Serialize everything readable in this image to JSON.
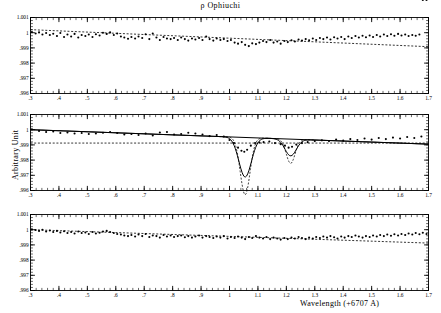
{
  "figure": {
    "title": "ρ Ophiuchi",
    "xlabel": "Wavelength (+6707 A)",
    "ylabel": "Arbitrary Unit"
  },
  "chart_data": {
    "type": "scatter",
    "title": "ρ Ophiuchi",
    "xlabel": "Wavelength (+6707 A)",
    "ylabel": "Arbitrary Unit",
    "xlim": [
      0.3,
      1.7
    ],
    "ylim": [
      0.996,
      1.001
    ],
    "xticks": [
      ".3",
      ".4",
      ".5",
      ".6",
      ".7",
      ".8",
      ".9",
      "1",
      "1.1",
      "1.2",
      "1.3",
      "1.4",
      "1.5",
      "1.6",
      "1.7"
    ],
    "xtick_values": [
      0.3,
      0.4,
      0.5,
      0.6,
      0.7,
      0.8,
      0.9,
      1.0,
      1.1,
      1.2,
      1.3,
      1.4,
      1.5,
      1.6,
      1.7
    ],
    "yticks": [
      "1.001",
      "1",
      ".999",
      ".998",
      ".997",
      ".996"
    ],
    "ytick_values": [
      1.001,
      1.0,
      0.999,
      0.998,
      0.997,
      0.996
    ],
    "minor_tick_step": 0.02,
    "grid": false,
    "legend": null,
    "panels": [
      {
        "name": "top-panel-observed-spectrum",
        "baseline": {
          "type": "dashed-line",
          "x": [
            0.3,
            1.7
          ],
          "y": [
            1.0002,
            0.99908
          ]
        },
        "series": [
          {
            "name": "observed flux",
            "marker": "filled-circle",
            "x": [
              0.305,
              0.318,
              0.33,
              0.342,
              0.355,
              0.368,
              0.38,
              0.393,
              0.405,
              0.418,
              0.43,
              0.443,
              0.455,
              0.468,
              0.48,
              0.493,
              0.505,
              0.518,
              0.53,
              0.543,
              0.555,
              0.568,
              0.58,
              0.593,
              0.605,
              0.618,
              0.63,
              0.643,
              0.655,
              0.668,
              0.68,
              0.693,
              0.705,
              0.718,
              0.73,
              0.743,
              0.755,
              0.768,
              0.78,
              0.793,
              0.805,
              0.818,
              0.83,
              0.843,
              0.855,
              0.868,
              0.88,
              0.893,
              0.905,
              0.918,
              0.93,
              0.943,
              0.955,
              0.968,
              0.98,
              0.993,
              1.005,
              1.018,
              1.03,
              1.043,
              1.055,
              1.068,
              1.08,
              1.093,
              1.105,
              1.118,
              1.13,
              1.143,
              1.155,
              1.168,
              1.18,
              1.193,
              1.205,
              1.218,
              1.23,
              1.243,
              1.255,
              1.268,
              1.28,
              1.293,
              1.305,
              1.318,
              1.33,
              1.343,
              1.355,
              1.368,
              1.38,
              1.393,
              1.405,
              1.418,
              1.43,
              1.443,
              1.455,
              1.468,
              1.48,
              1.493,
              1.505,
              1.518,
              1.53,
              1.543,
              1.555,
              1.568,
              1.58,
              1.593,
              1.605,
              1.618,
              1.63,
              1.643,
              1.655,
              1.668,
              1.68,
              1.693
            ],
            "y": [
              1.00005,
              0.99995,
              1.00002,
              0.99988,
              0.99998,
              0.99985,
              0.99993,
              0.99978,
              0.99998,
              0.99972,
              0.99988,
              0.99975,
              0.99992,
              0.99968,
              0.99985,
              0.99978,
              0.99988,
              0.99972,
              0.9999,
              0.99982,
              1.0,
              0.99992,
              1.00002,
              0.99985,
              0.99995,
              0.99975,
              0.99968,
              0.9996,
              0.99972,
              0.99962,
              0.99975,
              0.99965,
              0.9999,
              0.99958,
              0.99995,
              0.99968,
              0.99952,
              0.99972,
              0.99962,
              0.99958,
              0.99965,
              0.99952,
              0.99968,
              0.99958,
              0.99948,
              0.99962,
              0.99955,
              0.99965,
              0.99952,
              0.99975,
              0.99958,
              0.99948,
              0.99962,
              0.99952,
              0.99958,
              0.99945,
              0.99952,
              0.99935,
              0.99928,
              0.99938,
              0.9992,
              0.99912,
              0.9993,
              0.99925,
              0.99935,
              0.99945,
              0.99938,
              0.99952,
              0.99935,
              0.99942,
              0.99928,
              0.99945,
              0.99938,
              0.9995,
              0.99942,
              0.99955,
              0.99948,
              0.99958,
              0.9995,
              0.99962,
              0.99952,
              0.99965,
              0.99958,
              0.99968,
              0.99955,
              0.9997,
              0.99962,
              0.99972,
              0.99958,
              0.99975,
              0.99965,
              0.99978,
              0.99968,
              0.9998,
              0.9997,
              0.99982,
              0.99972,
              0.99985,
              0.99975,
              0.99988,
              0.99978,
              0.9999,
              0.9998,
              0.99992,
              0.99982,
              0.99988,
              0.99978,
              0.99985,
              0.9998,
              0.99988
            ]
          }
        ]
      },
      {
        "name": "middle-panel-fitted-spectrum",
        "baseline": {
          "type": "dashed-line",
          "x": [
            0.3,
            1.7
          ],
          "y": [
            0.99912,
            0.99912
          ]
        },
        "continuum": {
          "type": "solid-line",
          "x": [
            0.3,
            1.7
          ],
          "y": [
            1.0,
            0.99905
          ]
        },
        "fit": {
          "name": "total model fit",
          "style": "solid",
          "components": [
            {
              "name": "absorption line 1",
              "style": "dashed",
              "center": 1.055,
              "depth": 0.0026,
              "sigma": 0.022
            },
            {
              "name": "absorption line 2",
              "style": "dashed",
              "center": 1.215,
              "depth": 0.0011,
              "sigma": 0.02
            }
          ]
        },
        "series": [
          {
            "name": "observed flux",
            "marker": "filled-circle",
            "x": [
              0.305,
              0.33,
              0.355,
              0.38,
              0.405,
              0.43,
              0.455,
              0.48,
              0.505,
              0.53,
              0.555,
              0.58,
              0.605,
              0.63,
              0.655,
              0.68,
              0.705,
              0.73,
              0.755,
              0.78,
              0.805,
              0.83,
              0.855,
              0.88,
              0.905,
              0.93,
              0.955,
              0.98,
              1.0,
              1.015,
              1.03,
              1.042,
              1.052,
              1.062,
              1.075,
              1.09,
              1.105,
              1.12,
              1.14,
              1.16,
              1.18,
              1.195,
              1.208,
              1.22,
              1.235,
              1.255,
              1.275,
              1.3,
              1.325,
              1.35,
              1.375,
              1.4,
              1.425,
              1.45,
              1.475,
              1.5,
              1.525,
              1.55,
              1.575,
              1.6,
              1.625,
              1.65,
              1.675
            ],
            "y": [
              1.00002,
              0.99992,
              0.99985,
              0.99988,
              0.99978,
              0.99982,
              0.99975,
              0.99978,
              0.99972,
              0.99975,
              0.9998,
              0.99985,
              0.99978,
              0.99968,
              0.99972,
              0.99965,
              0.99975,
              0.99962,
              0.99982,
              0.99985,
              0.99968,
              0.99972,
              0.9998,
              0.99975,
              0.99968,
              0.99958,
              0.99965,
              0.99955,
              0.99932,
              0.99912,
              0.99882,
              0.99862,
              0.99855,
              0.99868,
              0.99895,
              0.99912,
              0.99915,
              0.99918,
              0.99922,
              0.99912,
              0.99905,
              0.99895,
              0.99882,
              0.99888,
              0.99902,
              0.99912,
              0.99918,
              0.99925,
              0.9993,
              0.99925,
              0.99935,
              0.99928,
              0.99938,
              0.99932,
              0.99942,
              0.99935,
              0.99945,
              0.99938,
              0.99948,
              0.99942,
              0.99952,
              0.99945,
              0.99955
            ]
          }
        ]
      },
      {
        "name": "bottom-panel-residual-spectrum",
        "baseline": {
          "type": "dashed-line",
          "x": [
            0.3,
            1.7
          ],
          "y": [
            1.0,
            0.99912
          ]
        },
        "series": [
          {
            "name": "residual flux",
            "marker": "filled-circle",
            "x": [
              0.305,
              0.318,
              0.33,
              0.342,
              0.355,
              0.368,
              0.38,
              0.393,
              0.405,
              0.418,
              0.43,
              0.443,
              0.455,
              0.468,
              0.48,
              0.493,
              0.505,
              0.518,
              0.53,
              0.543,
              0.555,
              0.568,
              0.58,
              0.593,
              0.605,
              0.618,
              0.63,
              0.643,
              0.655,
              0.668,
              0.68,
              0.693,
              0.705,
              0.718,
              0.73,
              0.743,
              0.755,
              0.768,
              0.78,
              0.793,
              0.805,
              0.818,
              0.83,
              0.843,
              0.855,
              0.868,
              0.88,
              0.893,
              0.905,
              0.918,
              0.93,
              0.943,
              0.955,
              0.968,
              0.98,
              0.993,
              1.005,
              1.018,
              1.03,
              1.043,
              1.055,
              1.068,
              1.08,
              1.093,
              1.105,
              1.118,
              1.13,
              1.143,
              1.155,
              1.168,
              1.18,
              1.193,
              1.205,
              1.218,
              1.23,
              1.243,
              1.255,
              1.268,
              1.28,
              1.293,
              1.305,
              1.318,
              1.33,
              1.343,
              1.355,
              1.368,
              1.38,
              1.393,
              1.405,
              1.418,
              1.43,
              1.443,
              1.455,
              1.468,
              1.48,
              1.493,
              1.505,
              1.518,
              1.53,
              1.543,
              1.555,
              1.568,
              1.58,
              1.593,
              1.605,
              1.618,
              1.63,
              1.643,
              1.655,
              1.668,
              1.68,
              1.693
            ],
            "y": [
              1.00002,
              0.99998,
              0.99992,
              1.0,
              0.99988,
              0.99995,
              0.99985,
              0.99992,
              0.99982,
              0.9999,
              0.99978,
              0.99985,
              0.99975,
              0.99988,
              0.99978,
              0.99982,
              0.99972,
              0.99985,
              0.99975,
              0.9998,
              0.99988,
              0.99992,
              0.99985,
              0.99978,
              0.99972,
              0.99968,
              0.99962,
              0.99958,
              0.99965,
              0.99955,
              0.99968,
              0.99958,
              0.99972,
              0.99952,
              0.99962,
              0.99958,
              0.99948,
              0.99965,
              0.99955,
              0.99962,
              0.99952,
              0.99958,
              0.99962,
              0.9995,
              0.99958,
              0.99948,
              0.99955,
              0.99962,
              0.99948,
              0.99958,
              0.99952,
              0.99945,
              0.99955,
              0.99948,
              0.99958,
              0.99942,
              0.99952,
              0.99945,
              0.99955,
              0.99948,
              0.99938,
              0.99952,
              0.99945,
              0.99958,
              0.99948,
              0.99942,
              0.99952,
              0.99938,
              0.99948,
              0.99942,
              0.99935,
              0.99945,
              0.99938,
              0.99948,
              0.99942,
              0.99952,
              0.99945,
              0.99938,
              0.99948,
              0.99942,
              0.99952,
              0.99945,
              0.99955,
              0.99948,
              0.99958,
              0.9995,
              0.99942,
              0.99955,
              0.99948,
              0.99958,
              0.99952,
              0.99962,
              0.99955,
              0.99948,
              0.99958,
              0.99952,
              0.99962,
              0.99955,
              0.99965,
              0.99958,
              0.99968,
              0.9996,
              0.9997,
              0.99962,
              0.99972,
              0.99965,
              0.99975,
              0.99968,
              0.99978,
              0.9997,
              0.9998,
              0.99972
            ]
          }
        ]
      }
    ]
  }
}
